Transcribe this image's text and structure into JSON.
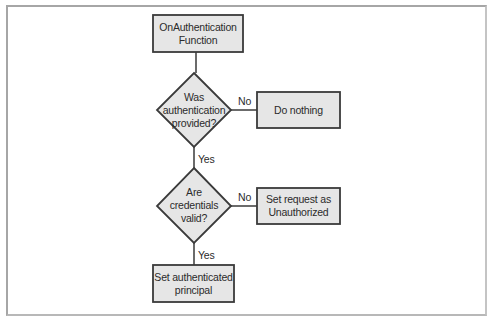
{
  "diagram": {
    "type": "flowchart",
    "nodes": {
      "start": {
        "shape": "rectangle",
        "line1": "OnAuthentication",
        "line2": "Function"
      },
      "decision1": {
        "shape": "diamond",
        "line1": "Was",
        "line2": "authentication",
        "line3": "provided?"
      },
      "do_nothing": {
        "shape": "rectangle",
        "line1": "Do nothing"
      },
      "decision2": {
        "shape": "diamond",
        "line1": "Are",
        "line2": "credentials",
        "line3": "valid?"
      },
      "unauthorized": {
        "shape": "rectangle",
        "line1": "Set request as",
        "line2": "Unauthorized"
      },
      "set_principal": {
        "shape": "rectangle",
        "line1": "Set authenticated",
        "line2": "principal"
      }
    },
    "edges": {
      "d1_no": {
        "from": "decision1",
        "to": "do_nothing",
        "label": "No"
      },
      "d1_yes": {
        "from": "decision1",
        "to": "decision2",
        "label": "Yes"
      },
      "d2_no": {
        "from": "decision2",
        "to": "unauthorized",
        "label": "No"
      },
      "d2_yes": {
        "from": "decision2",
        "to": "set_principal",
        "label": "Yes"
      }
    },
    "colors": {
      "node_fill": "#e6e6e6",
      "node_stroke": "#3a3a3a",
      "line": "#3a3a3a",
      "frame": "#a6a6a6"
    }
  }
}
